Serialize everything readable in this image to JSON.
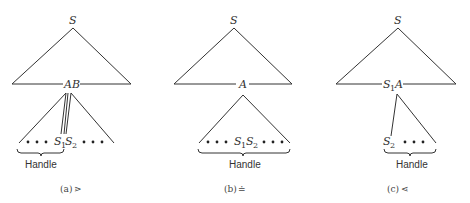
{
  "panels": [
    {
      "id": "a",
      "root": "S",
      "node_label": "AB",
      "leaf_s1": "S",
      "leaf_s1_sub": "1",
      "leaf_s2": "S",
      "leaf_s2_sub": "2",
      "handle": "Handle",
      "caption_letter": "(a)",
      "caption_relation": "⋗"
    },
    {
      "id": "b",
      "root": "S",
      "node_label": "A",
      "leaf_s1": "S",
      "leaf_s1_sub": "1",
      "leaf_s2": "S",
      "leaf_s2_sub": "2",
      "handle": "Handle",
      "caption_letter": "(b)",
      "caption_relation": "≐"
    },
    {
      "id": "c",
      "root": "S",
      "node_label_s": "S",
      "node_label_sub": "1",
      "node_label_a": "A",
      "leaf_s2": "S",
      "leaf_s2_sub": "2",
      "handle": "Handle",
      "caption_letter": "(c)",
      "caption_relation": "⋖"
    }
  ]
}
